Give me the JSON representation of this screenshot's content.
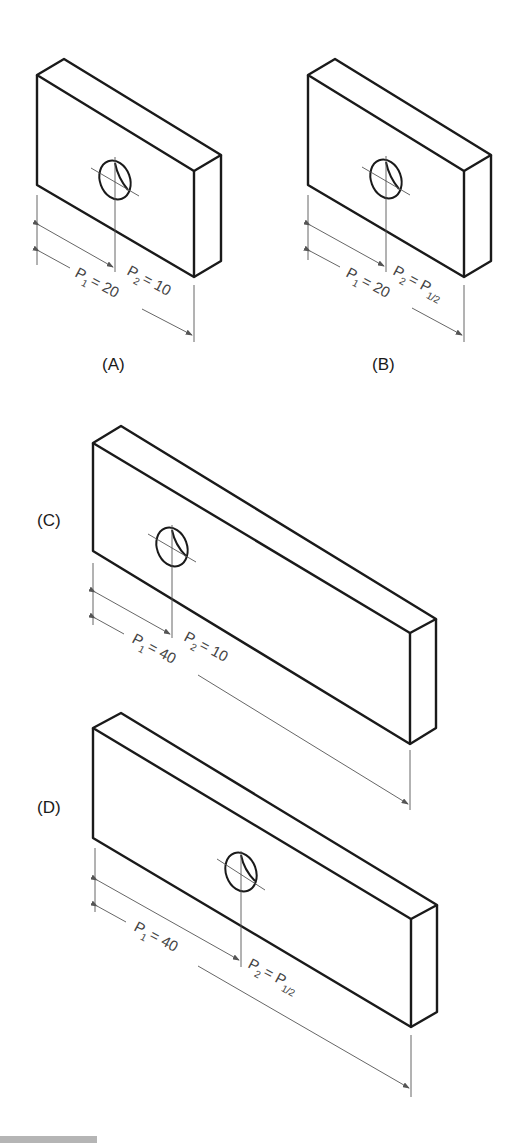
{
  "figures": [
    {
      "id": "A",
      "label": "(A)",
      "p1": "P",
      "p1_sub": "1",
      "p1_val": "= 20",
      "p2": "P",
      "p2_sub": "2",
      "p2_val": "= 10"
    },
    {
      "id": "B",
      "label": "(B)",
      "p1": "P",
      "p1_sub": "1",
      "p1_val": "= 20",
      "p2": "P",
      "p2_sub": "2",
      "p2_val": "= P",
      "p2_val_sub": "1/2"
    },
    {
      "id": "C",
      "label": "(C)",
      "p1": "P",
      "p1_sub": "1",
      "p1_val": "= 40",
      "p2": "P",
      "p2_sub": "2",
      "p2_val": "= 10"
    },
    {
      "id": "D",
      "label": "(D)",
      "p1": "P",
      "p1_sub": "1",
      "p1_val": "= 40",
      "p2": "P",
      "p2_sub": "2",
      "p2_val": "= P",
      "p2_val_sub": "1/2"
    }
  ],
  "colors": {
    "line": "#1a1a1a",
    "dimension": "#555555",
    "background": "#ffffff"
  }
}
